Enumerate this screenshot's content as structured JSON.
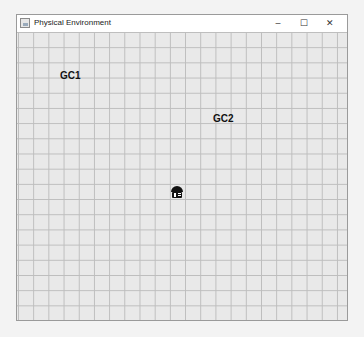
{
  "window": {
    "title": "Physical Environment",
    "controls": {
      "minimize": "–",
      "maximize": "☐",
      "close": "✕"
    }
  },
  "environment": {
    "labels": [
      {
        "text": "GC1",
        "x": 43,
        "y": 55
      },
      {
        "text": "GC2",
        "x": 196,
        "y": 98
      }
    ],
    "agent": {
      "x": 153,
      "y": 170,
      "color": "#111111"
    }
  }
}
